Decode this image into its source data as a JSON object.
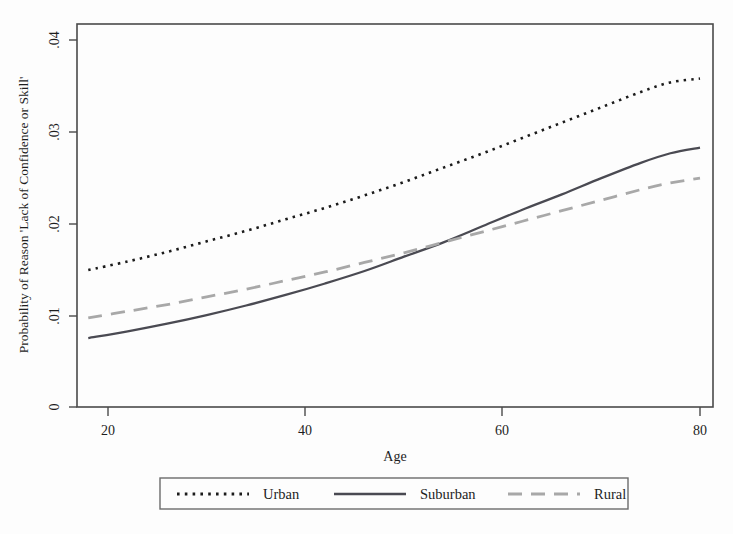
{
  "chart_data": {
    "type": "line",
    "title": "",
    "xlabel": "Age",
    "ylabel": "Probability of Reason 'Lack of Confidence or Skill'",
    "xlim": [
      18,
      80
    ],
    "ylim": [
      0,
      0.04
    ],
    "xticks": [
      "20",
      "40",
      "60",
      "80"
    ],
    "xtick_values": [
      20,
      40,
      60,
      80
    ],
    "yticks": [
      "0",
      ".01",
      ".02",
      ".03",
      ".04"
    ],
    "ytick_values": [
      0,
      0.01,
      0.02,
      0.03,
      0.04
    ],
    "grid": false,
    "legend_position": "below-outside",
    "x": [
      18,
      22,
      26,
      30,
      34,
      38,
      42,
      46,
      50,
      54,
      58,
      62,
      66,
      70,
      74,
      77,
      80
    ],
    "series": [
      {
        "name": "Urban",
        "style": "dotted",
        "color": "#1b1b1b",
        "width": 2.6,
        "values": [
          0.0143,
          0.0152,
          0.0162,
          0.0173,
          0.0184,
          0.0196,
          0.0208,
          0.0221,
          0.0235,
          0.025,
          0.0265,
          0.0281,
          0.0297,
          0.0313,
          0.0329,
          0.0339,
          0.0343
        ]
      },
      {
        "name": "Suburban",
        "style": "solid",
        "color": "#4a4a52",
        "width": 2.3,
        "values": [
          0.0072,
          0.0079,
          0.0087,
          0.0096,
          0.0106,
          0.0117,
          0.0129,
          0.0142,
          0.0157,
          0.0172,
          0.0189,
          0.0206,
          0.0222,
          0.0239,
          0.0255,
          0.0265,
          0.0271
        ]
      },
      {
        "name": "Rural",
        "style": "dashed",
        "color": "#a8a8a8",
        "width": 2.8,
        "values": [
          0.0093,
          0.01,
          0.0107,
          0.0115,
          0.0123,
          0.0132,
          0.0141,
          0.0151,
          0.0161,
          0.0172,
          0.0183,
          0.0194,
          0.0205,
          0.0216,
          0.0227,
          0.0234,
          0.0239
        ]
      }
    ],
    "legend_entries": [
      {
        "label": "Urban",
        "style": "dotted"
      },
      {
        "label": "Suburban",
        "style": "solid"
      },
      {
        "label": "Rural",
        "style": "dashed"
      }
    ]
  },
  "figure": {
    "background": "#fdfdfd",
    "frame_color": "#4a4a4a"
  }
}
